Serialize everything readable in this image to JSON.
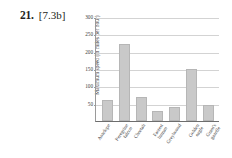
{
  "problem": {
    "number": "21.",
    "reference": "[7.3b]"
  },
  "chart_data": {
    "type": "bar",
    "title": "",
    "xlabel": "",
    "ylabel": "Maximum speed (in miles per hour)",
    "ylim": [
      0,
      300
    ],
    "yticks": [
      0,
      50,
      100,
      150,
      200,
      250,
      300
    ],
    "ytick_labels": [
      "",
      "50",
      "100",
      "150",
      "200",
      "250",
      "300"
    ],
    "grid": true,
    "legend": false,
    "bar_color": "#c9c9c9",
    "categories": [
      "Antelope",
      "Peregrine\nfalcon",
      "Cheetah",
      "Fastest\nhuman",
      "Greyhound",
      "Golden\neagle",
      "Grant's\ngazelle"
    ],
    "values": [
      60,
      222,
      70,
      28,
      40,
      150,
      47
    ]
  }
}
